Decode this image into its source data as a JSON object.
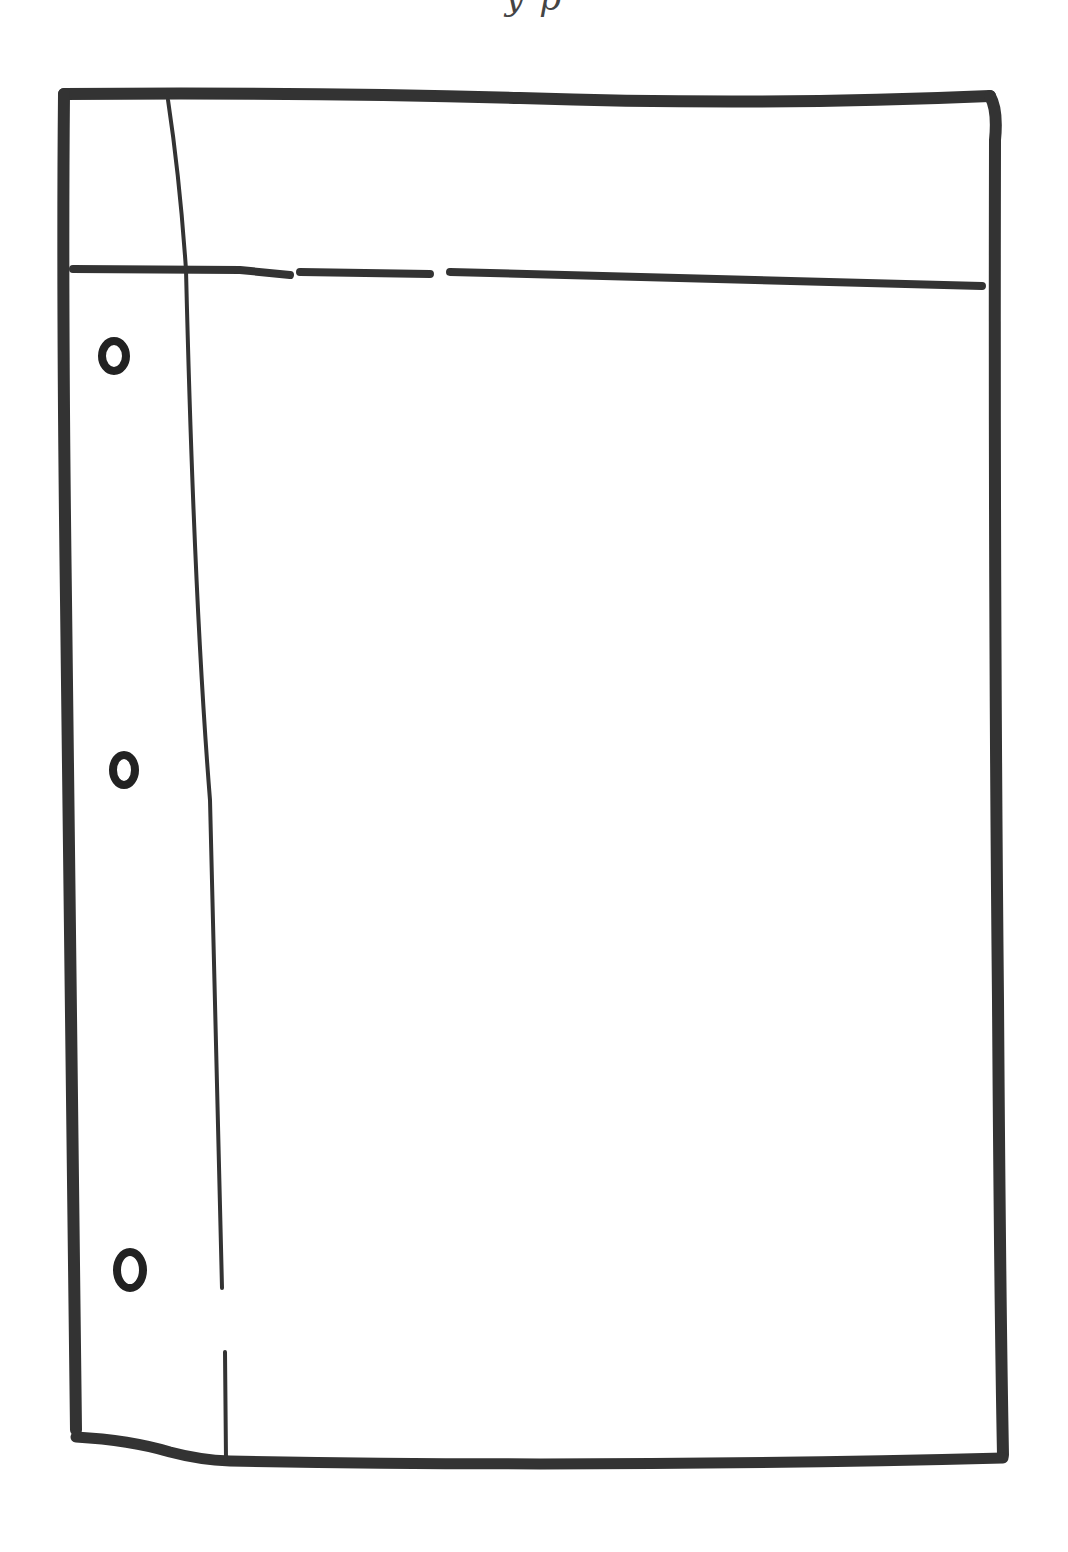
{
  "figure": {
    "cropped_caption_text": "y p",
    "stroke_color": "#333333",
    "background_color": "#ffffff"
  },
  "page": {
    "elements": [
      {
        "name": "outer-border",
        "type": "rectangle"
      },
      {
        "name": "header-line",
        "type": "horizontal-line"
      },
      {
        "name": "margin-line",
        "type": "vertical-line"
      },
      {
        "name": "binder-hole",
        "count": 3
      }
    ],
    "holes": [
      {
        "label": "top-hole"
      },
      {
        "label": "middle-hole"
      },
      {
        "label": "bottom-hole"
      }
    ]
  }
}
